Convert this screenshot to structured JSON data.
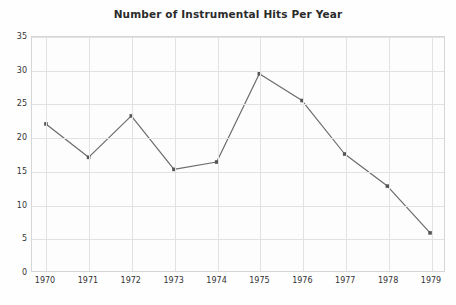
{
  "chart_data": {
    "type": "line",
    "title": "Number of Instrumental Hits Per Year",
    "xlabel": "",
    "ylabel": "",
    "categories": [
      "1970",
      "1971",
      "1972",
      "1973",
      "1974",
      "1975",
      "1976",
      "1977",
      "1978",
      "1979"
    ],
    "values": [
      22.0,
      17.0,
      23.2,
      15.2,
      16.3,
      29.5,
      25.5,
      17.5,
      12.7,
      5.7
    ],
    "series": [
      {
        "name": "Instrumental Hits",
        "values": [
          22.0,
          17.0,
          23.2,
          15.2,
          16.3,
          29.5,
          25.5,
          17.5,
          12.7,
          5.7
        ]
      }
    ],
    "ylim": [
      0,
      35
    ],
    "yticks": [
      "0",
      "5",
      "10",
      "15",
      "20",
      "25",
      "30",
      "35"
    ],
    "ytick_values": [
      0,
      5,
      10,
      15,
      20,
      25,
      30,
      35
    ],
    "xticks": [
      "1970",
      "1971",
      "1972",
      "1973",
      "1974",
      "1975",
      "1976",
      "1977",
      "1978",
      "1979"
    ],
    "grid": true,
    "legend": "none",
    "line_color": "#6b6b6b",
    "marker_color": "#555555",
    "grid_color": "#e2e2e2",
    "border_color": "#d6d6d6",
    "background_color": "#fdfdfd",
    "title_color": "#2b2b2b",
    "tick_label_color": "#333333"
  }
}
